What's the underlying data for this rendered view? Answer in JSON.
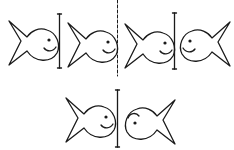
{
  "title": "",
  "diagram": {
    "colors": {
      "ink": "#1a1a1a",
      "background": "#ffffff"
    },
    "top_row": {
      "left_group": [
        {
          "id": "fish-1",
          "facing": "right",
          "smile": true
        },
        {
          "id": "mirror-line-1",
          "type": "solid-line"
        },
        {
          "id": "fish-2",
          "facing": "right",
          "smile": true
        }
      ],
      "separator": "dashed-line",
      "right_group": [
        {
          "id": "fish-3",
          "facing": "right",
          "smile": true
        },
        {
          "id": "mirror-line-2",
          "type": "solid-line"
        },
        {
          "id": "fish-4",
          "facing": "left",
          "smile": true
        }
      ]
    },
    "bottom_row": [
      {
        "id": "fish-5",
        "facing": "right",
        "smile": true
      },
      {
        "id": "mirror-line-3",
        "type": "solid-line"
      },
      {
        "id": "fish-6",
        "facing": "left",
        "smile": false,
        "mouth": "upside-down"
      }
    ]
  }
}
